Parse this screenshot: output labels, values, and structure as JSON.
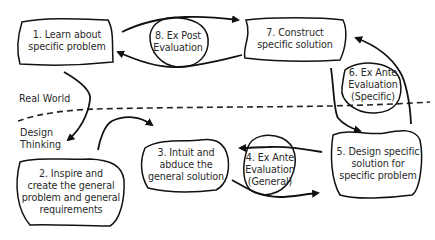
{
  "diagram": {
    "type": "process-cycle",
    "regions": {
      "upper": "Real World",
      "lower_line1": "Design",
      "lower_line2": "Thinking"
    },
    "nodes": [
      {
        "id": 1,
        "lines": [
          "1. Learn about",
          "specific problem"
        ],
        "shape": "cloud",
        "region": "Real World"
      },
      {
        "id": 2,
        "lines": [
          "2. Inspire and",
          "create the general",
          "problem and general",
          "requirements"
        ],
        "shape": "cloud",
        "region": "Design Thinking"
      },
      {
        "id": 3,
        "lines": [
          "3. Intuit and",
          "abduce the",
          "general solution"
        ],
        "shape": "cloud",
        "region": "Design Thinking"
      },
      {
        "id": 4,
        "lines": [
          "4. Ex Ante",
          "Evaluation",
          "(General)"
        ],
        "shape": "circle",
        "region": "Design Thinking"
      },
      {
        "id": 5,
        "lines": [
          "5. Design specific",
          "solution for",
          "specific problem"
        ],
        "shape": "cloud",
        "region": "Design Thinking"
      },
      {
        "id": 6,
        "lines": [
          "6. Ex Ante",
          "Evaluation",
          "(Specific)"
        ],
        "shape": "circle",
        "region": "Real World"
      },
      {
        "id": 7,
        "lines": [
          "7. Construct",
          "specific solution"
        ],
        "shape": "cloud",
        "region": "Real World"
      },
      {
        "id": 8,
        "lines": [
          "8. Ex Post",
          "Evaluation"
        ],
        "shape": "circle",
        "region": "Real World"
      }
    ],
    "edges": [
      {
        "from": 1,
        "to": 2,
        "label": ""
      },
      {
        "from": 2,
        "to": 3,
        "label": ""
      },
      {
        "from": 3,
        "to": 4,
        "via": "loop",
        "label": ""
      },
      {
        "from": 4,
        "to": 5,
        "via": "loop",
        "label": ""
      },
      {
        "from": 5,
        "to": 6,
        "via": "loop",
        "label": ""
      },
      {
        "from": 6,
        "to": 7,
        "via": "loop",
        "label": ""
      },
      {
        "from": 7,
        "to": 8,
        "via": "loop",
        "label": ""
      },
      {
        "from": 8,
        "to": 1,
        "via": "loop",
        "label": ""
      }
    ],
    "colors": {
      "stroke": "#111111",
      "text": "#2a2a2a",
      "background": "#ffffff"
    }
  }
}
